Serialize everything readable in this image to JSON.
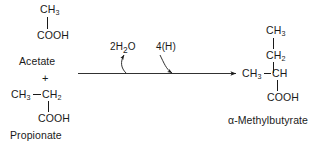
{
  "diagram": {
    "title_visible": false,
    "background_color": "#ffffff",
    "ink_color": "#1a1a1a",
    "reactants": {
      "acetate": {
        "name": "Acetate",
        "top_group": "CH",
        "top_sub": "3",
        "bottom_group": "COOH"
      },
      "plus_sign": "+",
      "propionate": {
        "name": "Propionate",
        "left_group": "CH",
        "left_sub": "3",
        "mid_group": "CH",
        "mid_sub": "2",
        "bottom_group": "COOH"
      }
    },
    "arrow": {
      "direction": "left-to-right",
      "reagent_in": {
        "label_prefix": "2H",
        "label_sub": "2",
        "label_suffix": "O"
      },
      "reagent_out": {
        "label": "4(H)"
      }
    },
    "product": {
      "name": "α-Methylbutyrate",
      "c4_group": "CH",
      "c4_sub": "3",
      "c3_group": "CH",
      "c3_sub": "2",
      "branch_methyl": "CH",
      "branch_methyl_sub": "3",
      "c2_group": "CH",
      "c1_group": "COOH"
    }
  }
}
